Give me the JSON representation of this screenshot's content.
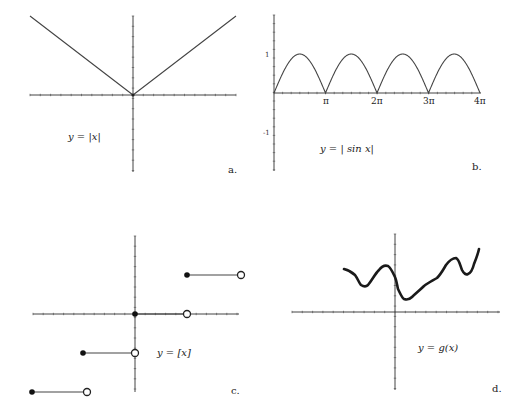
{
  "figure": {
    "panels": [
      {
        "id": "a",
        "panel_label": "a.",
        "equation": "y = |x|"
      },
      {
        "id": "b",
        "panel_label": "b.",
        "equation": "y = | sin x|",
        "y_ticks": [
          "1",
          "-1"
        ],
        "x_ticks": [
          "π",
          "2π",
          "3π",
          "4π"
        ]
      },
      {
        "id": "c",
        "panel_label": "c.",
        "equation": "y = [x]"
      },
      {
        "id": "d",
        "panel_label": "d.",
        "equation": "y = g(x)"
      }
    ]
  },
  "chart_data": [
    {
      "type": "line",
      "title": "y = |x|",
      "panel": "a",
      "x": [
        -2,
        -1,
        0,
        1,
        2
      ],
      "series": [
        {
          "name": "y = |x|",
          "values": [
            2,
            1,
            0,
            1,
            2
          ]
        }
      ],
      "xlim": [
        -2,
        2
      ],
      "ylim": [
        -1.5,
        1.5
      ],
      "grid": false,
      "legend": null
    },
    {
      "type": "line",
      "title": "y = |sin x|",
      "panel": "b",
      "x_tick_labels": [
        "π",
        "2π",
        "3π",
        "4π"
      ],
      "y_tick_labels": [
        "1",
        "-1"
      ],
      "x": [
        0,
        1.5708,
        3.1416,
        4.7124,
        6.2832,
        7.854,
        9.4248,
        10.9956,
        12.5664
      ],
      "series": [
        {
          "name": "y = |sin x|",
          "values": [
            0,
            1,
            0,
            1,
            0,
            1,
            0,
            1,
            0
          ]
        }
      ],
      "xlim": [
        0,
        12.5664
      ],
      "ylim": [
        -2,
        2
      ],
      "grid": false,
      "legend": null
    },
    {
      "type": "line",
      "title": "y = [x]",
      "panel": "c",
      "description": "greatest integer (floor) step function; filled dot at left end, open dot at right end of each step",
      "segments": [
        {
          "x_start": -2,
          "x_end": -1,
          "y": -2,
          "left": "closed",
          "right": "open"
        },
        {
          "x_start": -1,
          "x_end": 0,
          "y": -1,
          "left": "closed",
          "right": "open"
        },
        {
          "x_start": 0,
          "x_end": 1,
          "y": 0,
          "left": "closed",
          "right": "open"
        },
        {
          "x_start": 1,
          "x_end": 2,
          "y": 1,
          "left": "closed",
          "right": "open"
        }
      ],
      "xlim": [
        -2,
        2
      ],
      "ylim": [
        -1.5,
        1.5
      ],
      "grid": false,
      "legend": null
    },
    {
      "type": "line",
      "title": "y = g(x)",
      "panel": "d",
      "description": "irregular wiggly continuous curve, entirely above x-axis",
      "x": [
        -1.0,
        -0.7,
        -0.45,
        -0.2,
        0.0,
        0.15,
        0.4,
        0.7,
        0.9,
        1.1,
        1.3,
        1.5
      ],
      "series": [
        {
          "name": "g(x)",
          "values": [
            0.65,
            0.4,
            0.7,
            0.5,
            0.35,
            0.2,
            0.4,
            0.55,
            0.8,
            0.55,
            0.65,
            0.95
          ]
        }
      ],
      "xlim": [
        -2,
        2
      ],
      "ylim": [
        -1.5,
        1.5
      ],
      "grid": false,
      "legend": null
    }
  ]
}
